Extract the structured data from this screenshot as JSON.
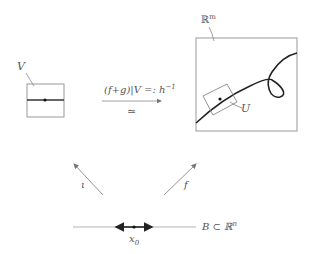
{
  "diagram": {
    "labels": {
      "V": "V",
      "Rm": "ℝ",
      "Rm_sup": "m",
      "map_top": "(f+g)|V =: h",
      "map_top_sup": "−1",
      "iso": "≃",
      "U": "U",
      "iota": "ι",
      "f": "f",
      "x0": "x",
      "x0_sub": "0",
      "B": "B ⊂ ℝ",
      "B_sup": "n"
    },
    "colors": {
      "line": "#888888",
      "thick": "#222222",
      "text": "#555555"
    }
  }
}
